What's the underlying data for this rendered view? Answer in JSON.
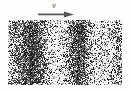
{
  "figure": {
    "background_color": "#fefefe",
    "width": 131,
    "height": 91,
    "caption": ""
  },
  "annotation": {
    "velocity_symbol": "v",
    "symbol_style": "italic",
    "symbol_color": "#4a4a4a",
    "arrow_name": "flow-direction-arrow",
    "arrow_direction": "right",
    "arrow_color": "#555555",
    "arrow_x": 38,
    "arrow_y": 12,
    "arrow_length": 34
  },
  "panel": {
    "name": "speckle-image-panel",
    "x": 8,
    "y": 20,
    "width": 114,
    "height": 65,
    "border": "none",
    "background_color": "#ffffff"
  },
  "chart_data": {
    "type": "heatmap",
    "title": "",
    "subtitle": "",
    "xlabel": "",
    "ylabel": "",
    "grid": false,
    "legend": "none",
    "colormap": "grayscale",
    "value_range": [
      0,
      1
    ],
    "x": [
      0,
      10,
      20,
      30,
      40,
      50,
      60,
      70,
      80,
      90,
      100,
      114
    ],
    "band_centers_px": [
      22,
      72,
      112
    ],
    "band_half_width_px": [
      11,
      12,
      9
    ],
    "band_strength": [
      1.0,
      0.92,
      0.55
    ],
    "column_density": [
      0.62,
      0.8,
      0.92,
      0.84,
      0.55,
      0.34,
      0.28,
      0.42,
      0.7,
      0.86,
      0.74,
      0.46,
      0.3,
      0.24,
      0.26,
      0.34,
      0.46,
      0.58,
      0.52,
      0.4,
      0.3,
      0.24,
      0.22,
      0.26,
      0.32,
      0.4,
      0.46,
      0.42,
      0.34,
      0.26,
      0.22,
      0.2
    ],
    "row_modulation": [
      0.92,
      0.98,
      1.0,
      0.99,
      0.96,
      0.94,
      0.95,
      0.97,
      0.99,
      1.0,
      0.98,
      0.95,
      0.93,
      0.94,
      0.96,
      0.98
    ],
    "speckle_scale_px": 1,
    "seed": 20240517,
    "ink_color": "#1a1a1a",
    "paper_color": "#ffffff"
  }
}
